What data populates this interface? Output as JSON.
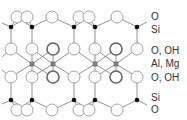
{
  "labels": [
    {
      "text": "O",
      "y": 11
    },
    {
      "text": "Si",
      "y": 24
    },
    {
      "text": "O, OH",
      "y": 45
    },
    {
      "text": "Al, Mg",
      "y": 58
    },
    {
      "text": "O, OH",
      "y": 72
    },
    {
      "text": "Si",
      "y": 92
    },
    {
      "text": "O",
      "y": 104
    }
  ],
  "colors": {
    "line": "#777777",
    "atom_outline": "#999999",
    "bold_atom_outline": "#666666",
    "si_dot": "#111111",
    "cation": "#888888",
    "text": "#333333"
  }
}
